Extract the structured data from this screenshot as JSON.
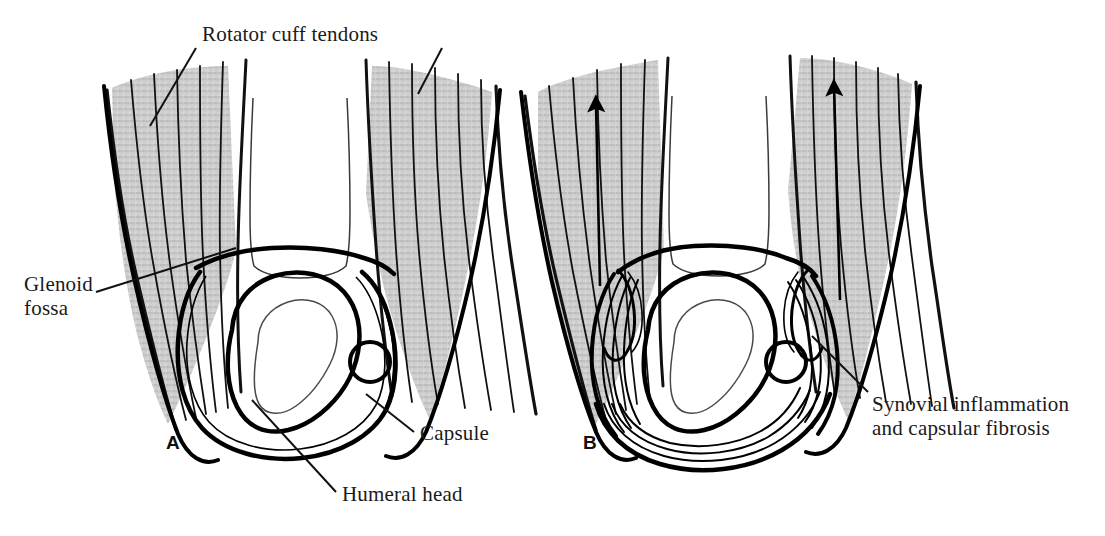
{
  "figure": {
    "background_color": "#ffffff",
    "ink_color": "#000000",
    "tendon_shade_color": "#c9c9c9",
    "width": 1105,
    "height": 536
  },
  "labels": {
    "rotator_cuff_tendons": "Rotator cuff tendons",
    "glenoid_fossa_line1": "Glenoid",
    "glenoid_fossa_line2": "fossa",
    "capsule": "Capsule",
    "humeral_head": "Humeral head",
    "synovial_line1": "Synovial inflammation",
    "synovial_line2": "and capsular fibrosis"
  },
  "panels": [
    {
      "letter": "A",
      "name": "normal-shoulder",
      "callouts": [
        "Rotator cuff tendons",
        "Glenoid fossa",
        "Capsule",
        "Humeral head"
      ],
      "arrows": 0
    },
    {
      "letter": "B",
      "name": "adhesive-capsulitis-shoulder",
      "callouts": [
        "Synovial inflammation and capsular fibrosis"
      ],
      "arrows": 2
    }
  ],
  "caption": {
    "text": "",
    "visible": false
  }
}
